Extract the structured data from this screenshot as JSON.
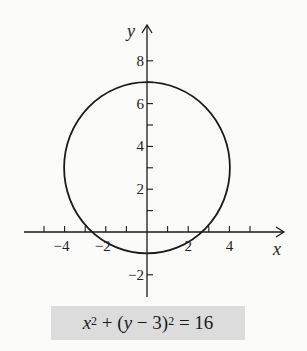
{
  "chart_data": {
    "type": "line",
    "title": "",
    "xlabel": "x",
    "ylabel": "y",
    "xlim": [
      -5.5,
      6.5
    ],
    "ylim": [
      -3,
      9.8
    ],
    "grid": false,
    "x_ticks": [
      -5,
      -4,
      -3,
      -2,
      -1,
      1,
      2,
      3,
      4,
      5
    ],
    "x_tick_labels": [
      "-4",
      "-2",
      "2",
      "4"
    ],
    "x_tick_label_values": [
      -4,
      -2,
      2,
      4
    ],
    "y_ticks": [
      -2,
      -1,
      1,
      2,
      3,
      4,
      5,
      6,
      7,
      8
    ],
    "y_tick_labels": [
      "8",
      "6",
      "4",
      "2",
      "-2"
    ],
    "y_tick_label_values": [
      8,
      6,
      4,
      2,
      -2
    ],
    "series": [
      {
        "name": "circle",
        "equation": "x^2 + (y - 3)^2 = 16",
        "center": [
          0,
          3
        ],
        "radius": 4
      }
    ],
    "annotation": "x² + (y − 3)² = 16"
  },
  "equation": {
    "x": "x",
    "exp1": "2",
    "plus": " + (",
    "y": "y",
    "minus": " − 3)",
    "exp2": "2",
    "rhs": " = 16"
  },
  "colors": {
    "stroke": "#1a1a1a",
    "label_bg": "#dcdcdc",
    "background": "#fbfbfa"
  }
}
